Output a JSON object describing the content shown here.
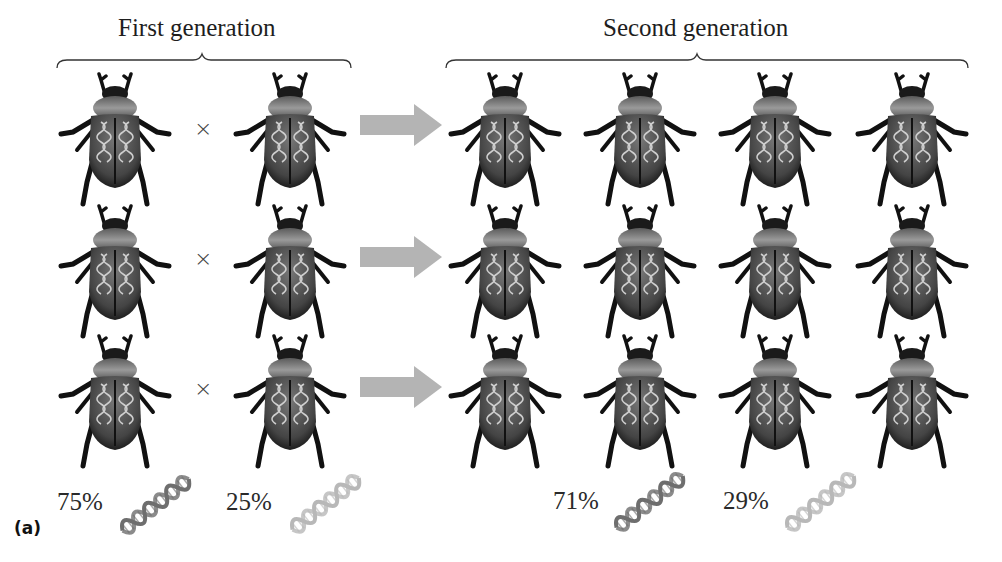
{
  "figure": {
    "panel_label": "(a)",
    "first_generation": {
      "title": "First generation",
      "rows": [
        {
          "parents": [
            "beetle",
            "beetle"
          ],
          "operator": "×"
        },
        {
          "parents": [
            "beetle",
            "beetle"
          ],
          "operator": "×"
        },
        {
          "parents": [
            "beetle",
            "beetle"
          ],
          "operator": "×"
        }
      ],
      "allele_frequencies": [
        {
          "label": "75%",
          "allele": "dark-dna"
        },
        {
          "label": "25%",
          "allele": "light-dna"
        }
      ]
    },
    "second_generation": {
      "title": "Second generation",
      "rows": [
        {
          "offspring_count": 4
        },
        {
          "offspring_count": 4
        },
        {
          "offspring_count": 4
        }
      ],
      "allele_frequencies": [
        {
          "label": "71%",
          "allele": "dark-dna"
        },
        {
          "label": "29%",
          "allele": "light-dna"
        }
      ]
    },
    "colors": {
      "arrow": "#b4b4b4",
      "beetle_body": "#2b2b2b",
      "beetle_elytra": "#5a5a5a",
      "dna_dark": "#6e6e6e",
      "dna_light": "#b8b8b8"
    }
  }
}
